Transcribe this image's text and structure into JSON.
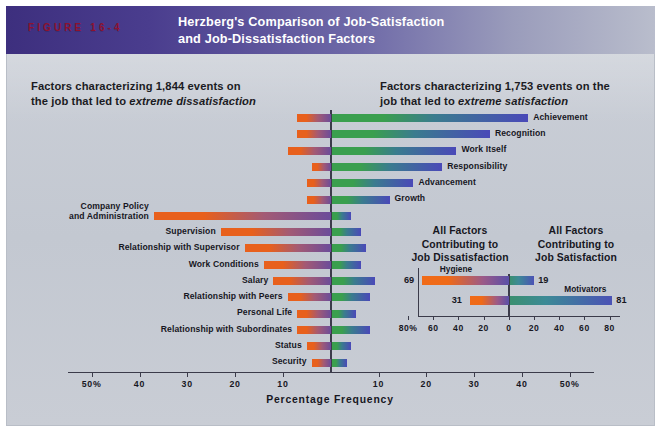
{
  "header": {
    "figure_number": "FIGURE 16-4",
    "title_line1": "Herzberg's Comparison of Job-Satisfaction",
    "title_line2": "and Job-Dissatisfaction Factors",
    "band_color": "#4a3d8e",
    "figure_number_color": "#8e1230"
  },
  "captions": {
    "left_plain1": "Factors characterizing 1,844 events on",
    "left_plain2": "the job that led to ",
    "left_italic": "extreme dissatisfaction",
    "right_plain1": "Factors characterizing 1,753 events on the",
    "right_plain2": "job that led to ",
    "right_italic": "extreme satisfaction"
  },
  "chart_data": {
    "type": "bar",
    "title": "Herzberg's Comparison of Job-Satisfaction and Job-Dissatisfaction Factors",
    "xlabel": "Percentage Frequency",
    "ylabel": "",
    "orientation": "horizontal-diverging",
    "xlim": [
      -50,
      50
    ],
    "grid": false,
    "left_axis_ticks": [
      "50%",
      "40",
      "30",
      "20",
      "10"
    ],
    "right_axis_ticks": [
      "10",
      "20",
      "30",
      "40",
      "50%"
    ],
    "center_tick": "0",
    "series": [
      {
        "name": "Dissatisfaction (left)",
        "color_start": "#e8601c",
        "color_end": "#6b4c9a"
      },
      {
        "name": "Satisfaction (right)",
        "color_start": "#3a9f4e",
        "color_end": "#4a49b8"
      }
    ],
    "categories": [
      {
        "label": "Achievement",
        "side": "right",
        "satisfaction": 41,
        "dissatisfaction": 7
      },
      {
        "label": "Recognition",
        "side": "right",
        "satisfaction": 33,
        "dissatisfaction": 7
      },
      {
        "label": "Work Itself",
        "side": "right",
        "satisfaction": 26,
        "dissatisfaction": 9
      },
      {
        "label": "Responsibility",
        "side": "right",
        "satisfaction": 23,
        "dissatisfaction": 4
      },
      {
        "label": "Advancement",
        "side": "right",
        "satisfaction": 17,
        "dissatisfaction": 5
      },
      {
        "label": "Growth",
        "side": "right",
        "satisfaction": 12,
        "dissatisfaction": 5
      },
      {
        "label": "Company Policy\nand Administration",
        "side": "left",
        "satisfaction": 4,
        "dissatisfaction": 37
      },
      {
        "label": "Supervision",
        "side": "left",
        "satisfaction": 6,
        "dissatisfaction": 23
      },
      {
        "label": "Relationship with Supervisor",
        "side": "left",
        "satisfaction": 7,
        "dissatisfaction": 18
      },
      {
        "label": "Work Conditions",
        "side": "left",
        "satisfaction": 6,
        "dissatisfaction": 14
      },
      {
        "label": "Salary",
        "side": "left",
        "satisfaction": 9,
        "dissatisfaction": 12
      },
      {
        "label": "Relationship with Peers",
        "side": "left",
        "satisfaction": 8,
        "dissatisfaction": 9
      },
      {
        "label": "Personal Life",
        "side": "left",
        "satisfaction": 5,
        "dissatisfaction": 7
      },
      {
        "label": "Relationship with Subordinates",
        "side": "left",
        "satisfaction": 8,
        "dissatisfaction": 7
      },
      {
        "label": "Status",
        "side": "left",
        "satisfaction": 4,
        "dissatisfaction": 5
      },
      {
        "label": "Security",
        "side": "left",
        "satisfaction": 3,
        "dissatisfaction": 4
      }
    ]
  },
  "inset": {
    "heading_left_line1": "All Factors",
    "heading_left_line2": "Contributing to",
    "heading_left_line3": "Job Dissatisfaction",
    "heading_right_line1": "All Factors",
    "heading_right_line2": "Contributing to",
    "heading_right_line3": "Job Satisfaction",
    "chart_data": {
      "type": "bar",
      "orientation": "horizontal-diverging",
      "xlim": [
        -80,
        80
      ],
      "left_ticks": [
        "80%",
        "60",
        "40",
        "20"
      ],
      "center_tick": "0",
      "right_ticks": [
        "20",
        "40",
        "60",
        "80"
      ],
      "rows": [
        {
          "name": "Hygiene",
          "left_value": 69,
          "right_value": 19
        },
        {
          "name": "Motivators",
          "left_value": 31,
          "right_value": 81
        }
      ]
    }
  }
}
